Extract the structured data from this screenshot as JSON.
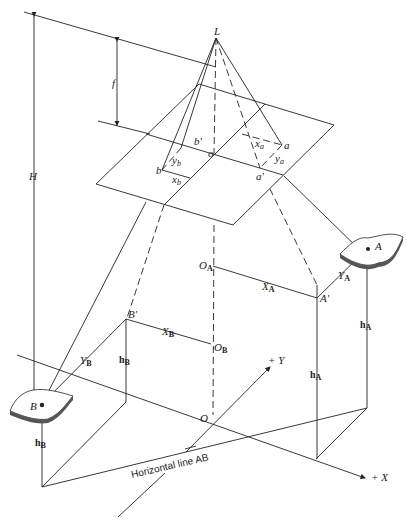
{
  "figure": {
    "type": "vertical aerial photograph geometry diagram",
    "labels": {
      "exposure_station": "L",
      "focal_length": "f",
      "flying_height": "H",
      "principal_point": "o",
      "image_point_a": "a",
      "image_point_a_prime": "a'",
      "image_point_b": "b",
      "image_point_b_prime": "b'",
      "x_a": "x",
      "x_a_sub": "a",
      "y_a": "y",
      "y_a_sub": "a",
      "x_b": "x",
      "x_b_sub": "b",
      "y_b": "y",
      "y_b_sub": "b",
      "ground_point_A": "A",
      "ground_point_B": "B",
      "A_prime": "A'",
      "B_prime": "B'",
      "O_A": "O",
      "O_A_sub": "A",
      "O_B": "O",
      "O_B_sub": "B",
      "X_A": "X",
      "X_A_sub": "A",
      "Y_A": "Y",
      "Y_A_sub": "A",
      "X_B": "X",
      "X_B_sub": "B",
      "Y_B": "Y",
      "Y_B_sub": "B",
      "h_A": "h",
      "h_A_sub": "A",
      "h_B": "h",
      "h_B_sub": "B",
      "origin": "O",
      "plus_y_axis": "+ Y",
      "plus_x_axis": "+ X",
      "horizontal_line": "Horizontal line AB"
    }
  }
}
